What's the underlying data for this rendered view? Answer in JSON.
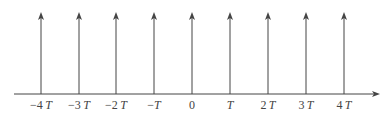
{
  "diagram": {
    "type": "impulse-train",
    "axis": {
      "y": 94,
      "x_start": 14,
      "x_end": 380,
      "color": "#444444"
    },
    "impulse": {
      "top_y": 12,
      "color": "#444444"
    },
    "impulses": [
      {
        "x": 41,
        "label": "−4T"
      },
      {
        "x": 79,
        "label": "−3T"
      },
      {
        "x": 116,
        "label": "−2T"
      },
      {
        "x": 154,
        "label": "−T"
      },
      {
        "x": 192,
        "label": "0"
      },
      {
        "x": 230,
        "label": "T"
      },
      {
        "x": 268,
        "label": "2T"
      },
      {
        "x": 306,
        "label": "3T"
      },
      {
        "x": 344,
        "label": "4T"
      }
    ]
  }
}
